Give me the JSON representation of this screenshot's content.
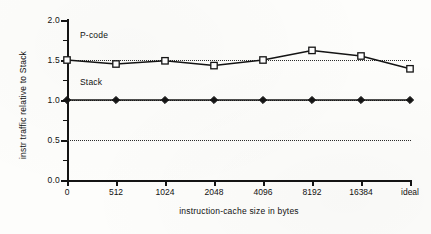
{
  "chart_data": {
    "type": "line",
    "title": "",
    "subtitle": "",
    "xlabel": "instruction-cache size in bytes",
    "ylabel": "instr traffic relative to Stack",
    "categories": [
      "0",
      "512",
      "1024",
      "2048",
      "4096",
      "8192",
      "16384",
      "ideal"
    ],
    "ylim": [
      0.0,
      2.0
    ],
    "yticks": [
      "0.0",
      "0.5",
      "1.0",
      "1.5",
      "2.0"
    ],
    "ytick_values": [
      0.0,
      0.5,
      1.0,
      1.5,
      2.0
    ],
    "yminor_step": 0.25,
    "grid": "horizontal dotted reference lines at 0.5, 1.0 and 1.5",
    "gridline_values": [
      0.5,
      1.0,
      1.5
    ],
    "legend": "inline labels placed next to each series",
    "legend_position": "inline",
    "series": [
      {
        "name": "P-code",
        "marker": "open-square",
        "values": [
          1.5,
          1.45,
          1.49,
          1.43,
          1.5,
          1.62,
          1.55,
          1.39
        ]
      },
      {
        "name": "Stack",
        "marker": "filled-diamond",
        "values": [
          1.0,
          1.0,
          1.0,
          1.0,
          1.0,
          1.0,
          1.0,
          1.0
        ]
      }
    ],
    "annotations": [
      {
        "text": "P-code",
        "series": "P-code"
      },
      {
        "text": "Stack",
        "series": "Stack"
      }
    ],
    "colors": {
      "line": "#141414",
      "axis": "#141414",
      "grid": "#2b2b2b",
      "background": "#fdfdfb",
      "marker_fill": "#ffffff"
    }
  }
}
